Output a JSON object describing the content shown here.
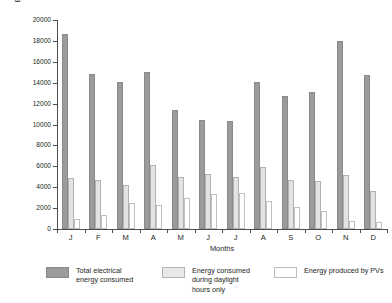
{
  "chart_data": {
    "type": "bar",
    "title": "",
    "subtitle": "",
    "xlabel": "Months",
    "ylabel": "Energy consumption/production (kWh/month)",
    "categories": [
      "J",
      "F",
      "M",
      "A",
      "M",
      "J",
      "J",
      "A",
      "S",
      "O",
      "N",
      "D"
    ],
    "ylim": [
      0,
      20000
    ],
    "ytick_values": [
      0,
      2000,
      4000,
      6000,
      8000,
      10000,
      12000,
      14000,
      16000,
      18000,
      20000
    ],
    "ytick_labels": [
      "0",
      "2000",
      "4000",
      "6000",
      "8000",
      "10000",
      "12000",
      "14000",
      "16000",
      "18000",
      "20000"
    ],
    "grid": false,
    "legend_position": "bottom",
    "series": [
      {
        "name": "Total electrical\nenergy consumed",
        "color": "#9b9b9b",
        "values": [
          18700,
          14800,
          14100,
          15000,
          11400,
          10400,
          10300,
          14100,
          12700,
          13100,
          18000,
          14700
        ]
      },
      {
        "name": "Energy consumed\nduring daylight\nhours only",
        "color": "#e3e3e3",
        "values": [
          4900,
          4700,
          4250,
          6150,
          4950,
          5250,
          5000,
          5900,
          4700,
          4600,
          5150,
          3650
        ]
      },
      {
        "name": "Energy produced by PVs",
        "color": "#ffffff",
        "values": [
          1000,
          1300,
          2450,
          2300,
          2950,
          3350,
          3400,
          2650,
          2150,
          1750,
          800,
          700
        ]
      }
    ]
  },
  "legend": {
    "items": [
      {
        "label": "Total electrical\nenergy consumed"
      },
      {
        "label": "Energy consumed\nduring daylight\nhours only"
      },
      {
        "label": "Energy produced by PVs"
      }
    ]
  }
}
